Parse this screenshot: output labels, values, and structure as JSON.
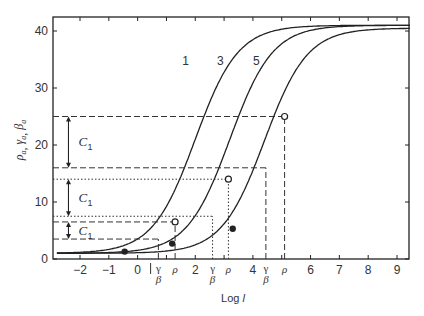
{
  "chart_data": {
    "type": "line",
    "title": "",
    "xlabel": "Log l",
    "ylabel": "ρa, γa, βa",
    "xlim": [
      -2.8,
      9.5
    ],
    "ylim": [
      0,
      42
    ],
    "x_ticks": [
      -2,
      -1,
      0,
      1,
      2,
      3,
      4,
      5,
      6,
      7,
      8,
      9
    ],
    "x_tick_labels": [
      "-2",
      "-1",
      "0",
      "",
      "2",
      "",
      "4",
      "",
      "6",
      "7",
      "8",
      "9"
    ],
    "y_ticks": [
      0,
      10,
      20,
      30,
      40
    ],
    "grid": false,
    "series": [
      {
        "name": "1",
        "midpoint": 2.0,
        "plateau": 41,
        "base": 1
      },
      {
        "name": "3",
        "midpoint": 3.2,
        "plateau": 41,
        "base": 1
      },
      {
        "name": "5",
        "midpoint": 4.4,
        "plateau": 40.5,
        "base": 1
      }
    ],
    "open_points": [
      {
        "x": 1.3,
        "y": 6.5
      },
      {
        "x": 3.15,
        "y": 14
      },
      {
        "x": 5.1,
        "y": 25
      }
    ],
    "filled_points": [
      {
        "x": -0.45,
        "y": 1.3
      },
      {
        "x": 1.2,
        "y": 2.7
      },
      {
        "x": 3.3,
        "y": 5.3
      }
    ],
    "annotations": {
      "curve_labels": [
        "1",
        "3",
        "5"
      ],
      "interval_labels": [
        "C1",
        "C1",
        "C1"
      ],
      "x_markers": [
        "γ/β",
        "ρ",
        "γ/β",
        "ρ",
        "γ/β",
        "ρ"
      ],
      "dashed_levels": [
        25,
        16,
        6.5,
        3.5
      ],
      "dotted_levels": [
        14,
        7.5
      ]
    }
  },
  "axis": {
    "ylabel_rho": "ρ",
    "ylabel_gamma": "γ",
    "ylabel_beta": "β",
    "ylabel_sub": "a",
    "xlabel": "Log l"
  },
  "labels": {
    "c1": "C",
    "c1_sub": "1",
    "gamma": "γ",
    "beta": "β",
    "rho": "ρ"
  }
}
